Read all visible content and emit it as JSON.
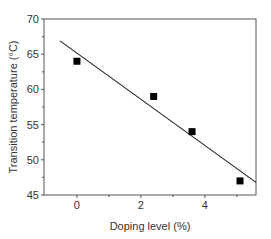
{
  "chart_data": {
    "type": "scatter",
    "title": "",
    "xlabel": "Doping level (%)",
    "ylabel": "Transition temperature (°C)",
    "xlim": [
      -1.03,
      5.6
    ],
    "ylim": [
      45,
      70
    ],
    "x_ticks": [
      0,
      2,
      4
    ],
    "x_tick_labels": [
      "0",
      "2",
      "4"
    ],
    "x_minor_ticks": [
      1,
      3,
      5
    ],
    "y_ticks": [
      45,
      50,
      55,
      60,
      65,
      70
    ],
    "y_tick_labels": [
      "45",
      "50",
      "55",
      "60",
      "65",
      "70"
    ],
    "grid": false,
    "legend": null,
    "series": [
      {
        "name": "Measured",
        "kind": "scatter",
        "marker": "square",
        "color": "#000000",
        "x": [
          0,
          2.4,
          3.6,
          5.1
        ],
        "y": [
          64,
          59,
          54,
          47
        ]
      },
      {
        "name": "Linear fit",
        "kind": "line",
        "color": "#222222",
        "x": [
          -0.53,
          5.6
        ],
        "y": [
          66.9,
          46.8
        ]
      }
    ]
  },
  "colors": {
    "axis": "#555555",
    "marker": "#000000",
    "fit_line": "#222222",
    "text": "#333333"
  }
}
